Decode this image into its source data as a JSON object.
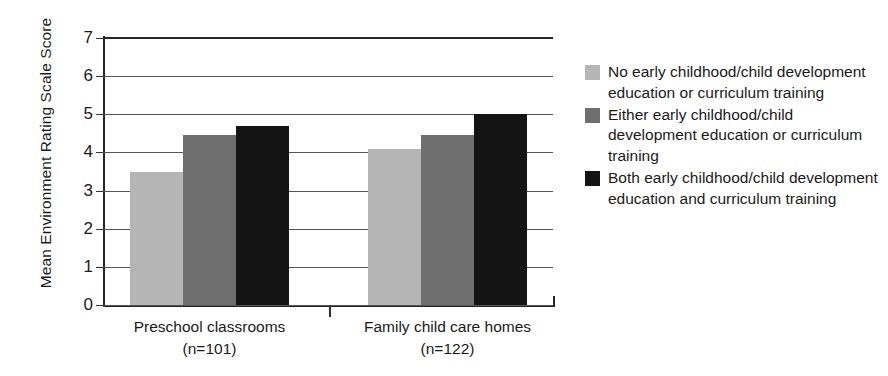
{
  "chart_data": {
    "type": "bar",
    "title": "",
    "xlabel": "",
    "ylabel": "Mean Environment Rating Scale Score",
    "ylim": [
      0,
      7
    ],
    "yticks": [
      "0",
      "1",
      "2",
      "3",
      "4",
      "5",
      "6",
      "7"
    ],
    "grid": true,
    "legend_position": "right",
    "categories": [
      "Preschool classrooms",
      "Family child care homes"
    ],
    "category_counts": [
      "(n=101)",
      "(n=122)"
    ],
    "series": [
      {
        "name": "No early childhood/child development education or curriculum training",
        "color": "#b5b5b5",
        "values": [
          3.5,
          4.1
        ]
      },
      {
        "name": "Either early childhood/child development education or curriculum training",
        "color": "#6f6f6f",
        "values": [
          4.45,
          4.45
        ]
      },
      {
        "name": "Both early childhood/child development education and curriculum training",
        "color": "#141414",
        "values": [
          4.7,
          5.0
        ]
      }
    ]
  },
  "axis": {
    "y_title": "Mean Environment Rating Scale Score"
  },
  "legend": {
    "items": [
      {
        "label": "No early childhood/child development education or curriculum training",
        "color": "#b5b5b5"
      },
      {
        "label": "Either early childhood/child development education or curriculum training",
        "color": "#6f6f6f"
      },
      {
        "label": "Both early childhood/child development education and curriculum training",
        "color": "#141414"
      }
    ]
  }
}
